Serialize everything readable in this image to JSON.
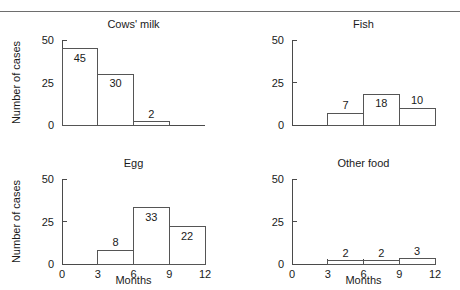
{
  "figure": {
    "panel_order": [
      "cows_milk",
      "fish",
      "egg",
      "other_food"
    ],
    "shared_ylabel": "Number of cases",
    "shared_xlabel": "Months",
    "y_ticks": [
      "0",
      "25",
      "50"
    ],
    "x_ticks": [
      "0",
      "3",
      "6",
      "9",
      "12"
    ],
    "axis_color": "#4a4a4a",
    "bar_edge_color": "#555555",
    "bar_fill_color": "#ffffff",
    "rule_color": "#6e6e6e"
  },
  "chart_data": [
    {
      "type": "bar",
      "title": "Cows' milk",
      "xlabel": "",
      "ylabel": "Number of cases",
      "categories": [
        "0-3",
        "3-6",
        "6-9",
        "9-12"
      ],
      "bin_edges": [
        0,
        3,
        6,
        9,
        12
      ],
      "values": [
        45,
        30,
        2,
        0
      ],
      "value_labels": [
        "45",
        "30",
        "2"
      ],
      "ylim": [
        0,
        50
      ],
      "yticks": [
        0,
        25,
        50
      ],
      "ytick_labels": [
        "0",
        "25",
        "50"
      ],
      "xlim": [
        0,
        12
      ],
      "xticks": [
        0,
        3,
        6,
        9,
        12
      ],
      "xtick_labels": [
        "",
        "",
        "",
        "",
        ""
      ],
      "xtick_labels_visible": false,
      "ylabel_visible": true,
      "grid": false,
      "legend": false
    },
    {
      "type": "bar",
      "title": "Fish",
      "xlabel": "",
      "ylabel": "",
      "categories": [
        "0-3",
        "3-6",
        "6-9",
        "9-12"
      ],
      "bin_edges": [
        0,
        3,
        6,
        9,
        12
      ],
      "values": [
        0,
        7,
        18,
        10
      ],
      "value_labels": [
        "7",
        "18",
        "10"
      ],
      "ylim": [
        0,
        50
      ],
      "yticks": [
        0,
        25,
        50
      ],
      "ytick_labels": [
        "0",
        "25",
        "50"
      ],
      "xlim": [
        0,
        12
      ],
      "xticks": [
        0,
        3,
        6,
        9,
        12
      ],
      "xtick_labels": [
        "",
        "",
        "",
        "",
        ""
      ],
      "xtick_labels_visible": false,
      "ylabel_visible": false,
      "grid": false,
      "legend": false
    },
    {
      "type": "bar",
      "title": "Egg",
      "xlabel": "Months",
      "ylabel": "Number of cases",
      "categories": [
        "0-3",
        "3-6",
        "6-9",
        "9-12"
      ],
      "bin_edges": [
        0,
        3,
        6,
        9,
        12
      ],
      "values": [
        0,
        8,
        33,
        22
      ],
      "value_labels": [
        "8",
        "33",
        "22"
      ],
      "ylim": [
        0,
        50
      ],
      "yticks": [
        0,
        25,
        50
      ],
      "ytick_labels": [
        "0",
        "25",
        "50"
      ],
      "xlim": [
        0,
        12
      ],
      "xticks": [
        0,
        3,
        6,
        9,
        12
      ],
      "xtick_labels": [
        "0",
        "3",
        "6",
        "9",
        "12"
      ],
      "xtick_labels_visible": true,
      "ylabel_visible": true,
      "grid": false,
      "legend": false
    },
    {
      "type": "bar",
      "title": "Other food",
      "xlabel": "Months",
      "ylabel": "",
      "categories": [
        "0-3",
        "3-6",
        "6-9",
        "9-12"
      ],
      "bin_edges": [
        0,
        3,
        6,
        9,
        12
      ],
      "values": [
        0,
        2,
        2,
        3
      ],
      "value_labels": [
        "2",
        "2",
        "3"
      ],
      "ylim": [
        0,
        50
      ],
      "yticks": [
        0,
        25,
        50
      ],
      "ytick_labels": [
        "0",
        "25",
        "50"
      ],
      "xlim": [
        0,
        12
      ],
      "xticks": [
        0,
        3,
        6,
        9,
        12
      ],
      "xtick_labels": [
        "0",
        "3",
        "6",
        "9",
        "12"
      ],
      "xtick_labels_visible": true,
      "ylabel_visible": false,
      "grid": false,
      "legend": false
    }
  ]
}
